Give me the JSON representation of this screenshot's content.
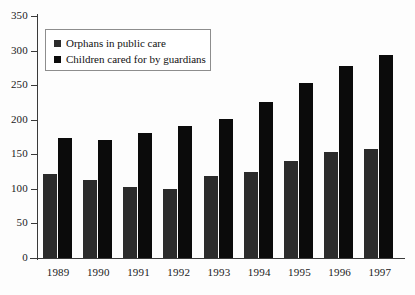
{
  "chart_data": {
    "type": "bar",
    "title": "",
    "xlabel": "",
    "ylabel": "",
    "categories": [
      "1989",
      "1990",
      "1991",
      "1992",
      "1993",
      "1994",
      "1995",
      "1996",
      "1997"
    ],
    "series": [
      {
        "name": "Orphans in public care",
        "color": "#2b2b2b",
        "values": [
          122,
          113,
          103,
          100,
          118,
          125,
          141,
          153,
          158
        ]
      },
      {
        "name": "Children cared for by guardians",
        "color": "#0b0b0b",
        "values": [
          174,
          171,
          181,
          191,
          201,
          226,
          253,
          278,
          294
        ]
      }
    ],
    "ylim": [
      0,
      350
    ],
    "ytick_step": 50,
    "yticks": [
      "0",
      "50",
      "100",
      "150",
      "200",
      "250",
      "300",
      "350"
    ],
    "grid": false,
    "legend_position": "top-left"
  },
  "axes": {
    "y_axis_name": "value-axis",
    "x_axis_name": "year-axis"
  }
}
